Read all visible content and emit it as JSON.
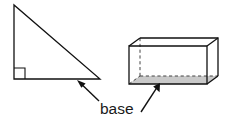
{
  "figure": {
    "title": "base",
    "background_color": "#ffffff",
    "line_color": "#111111",
    "dashed_line_color": "#444444",
    "shade_color": "#c9c9c9",
    "label": {
      "text": "base",
      "x": 100,
      "y": 114
    },
    "shapes": [
      {
        "name": "right-triangle",
        "type": "triangle",
        "vertices": [
          {
            "x": 14,
            "y": 5
          },
          {
            "x": 14,
            "y": 79
          },
          {
            "x": 100,
            "y": 79
          }
        ],
        "right_angle_marker": {
          "corner": {
            "x": 14,
            "y": 79
          },
          "size": 11
        },
        "base_edge": [
          {
            "x": 14,
            "y": 79
          },
          {
            "x": 100,
            "y": 79
          }
        ]
      },
      {
        "name": "rectangular-prism",
        "type": "prism",
        "front_face": [
          {
            "x": 129,
            "y": 46
          },
          {
            "x": 207,
            "y": 46
          },
          {
            "x": 207,
            "y": 84
          },
          {
            "x": 129,
            "y": 84
          }
        ],
        "depth_offset": {
          "dx": 11,
          "dy": -8
        },
        "back_face": [
          {
            "x": 140,
            "y": 38
          },
          {
            "x": 218,
            "y": 38
          },
          {
            "x": 218,
            "y": 76
          },
          {
            "x": 140,
            "y": 76
          }
        ],
        "hidden_edges": [
          [
            {
              "x": 140,
              "y": 38
            },
            {
              "x": 140,
              "y": 76
            }
          ],
          [
            {
              "x": 140,
              "y": 76
            },
            {
              "x": 218,
              "y": 76
            }
          ],
          [
            {
              "x": 129,
              "y": 84
            },
            {
              "x": 140,
              "y": 76
            }
          ]
        ],
        "base_face": [
          {
            "x": 129,
            "y": 84
          },
          {
            "x": 207,
            "y": 84
          },
          {
            "x": 218,
            "y": 76
          },
          {
            "x": 140,
            "y": 76
          }
        ]
      }
    ],
    "arrows": [
      {
        "name": "arrow-to-triangle-base",
        "tail": {
          "x": 99,
          "y": 101
        },
        "tip": {
          "x": 77,
          "y": 80
        }
      },
      {
        "name": "arrow-to-prism-base",
        "tail": {
          "x": 141,
          "y": 112
        },
        "tip": {
          "x": 160,
          "y": 83
        }
      }
    ]
  }
}
